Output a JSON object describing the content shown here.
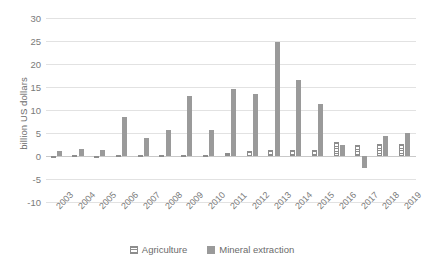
{
  "chart_data": {
    "type": "bar",
    "title": "",
    "xlabel": "",
    "ylabel": "billion US dollars",
    "ylim": [
      -10,
      30
    ],
    "yticks": [
      30,
      25,
      20,
      15,
      10,
      5,
      0,
      -5,
      -10
    ],
    "grid": true,
    "legend_position": "bottom",
    "categories": [
      "2003",
      "2004",
      "2005",
      "2006",
      "2007",
      "2008",
      "2009",
      "2010",
      "2011",
      "2012",
      "2013",
      "2014",
      "2015",
      "2016",
      "2017",
      "2018",
      "2019"
    ],
    "series": [
      {
        "name": "Agriculture",
        "color": "#8d8d8d",
        "pattern": "horizontal-stripes",
        "values": [
          0.1,
          0.2,
          0.1,
          0.15,
          0.2,
          0.2,
          0.3,
          0.3,
          0.6,
          1.0,
          1.2,
          1.3,
          1.4,
          3.0,
          2.4,
          2.6,
          2.7
        ]
      },
      {
        "name": "Mineral extraction",
        "color": "#9a9a9a",
        "pattern": "solid",
        "values": [
          1.0,
          1.6,
          1.4,
          8.5,
          4.0,
          5.7,
          13.0,
          5.6,
          14.6,
          13.4,
          24.7,
          16.5,
          11.2,
          2.3,
          -2.5,
          4.3,
          5.0
        ]
      }
    ]
  },
  "legend": {
    "items": [
      {
        "label": "Agriculture"
      },
      {
        "label": "Mineral extraction"
      }
    ]
  },
  "axis": {
    "y_title": "billion US dollars"
  }
}
